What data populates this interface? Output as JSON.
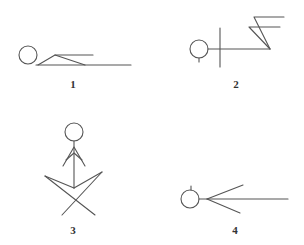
{
  "diagram": {
    "figures": [
      {
        "id": 1,
        "label": "1",
        "pose": "lying flat, knees bent"
      },
      {
        "id": 2,
        "label": "2",
        "pose": "lying, arms raised, legs bent upward"
      },
      {
        "id": 3,
        "label": "3",
        "pose": "sitting cross-legged, arms folded"
      },
      {
        "id": 4,
        "label": "4",
        "pose": "lying flat, legs spread"
      }
    ],
    "stroke_color": "#555555",
    "label_color": "#333333",
    "background": "#ffffff"
  }
}
